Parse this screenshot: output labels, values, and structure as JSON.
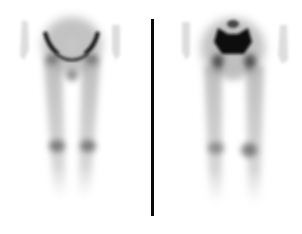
{
  "image": {
    "kind": "bone-scintigraphy",
    "width": 302,
    "height": 234,
    "background": "#ffffff",
    "ink": "#1a1a1a",
    "divider": {
      "x": 151,
      "y_top": 19,
      "y_bottom": 216,
      "color": "#0a0a0a"
    },
    "views": [
      {
        "id": "left-view",
        "label": "",
        "region": "pelvis-and-lower-limbs",
        "center_x": 74
      },
      {
        "id": "right-view",
        "label": "",
        "region": "pelvis-and-lower-limbs",
        "center_x": 229
      }
    ]
  }
}
